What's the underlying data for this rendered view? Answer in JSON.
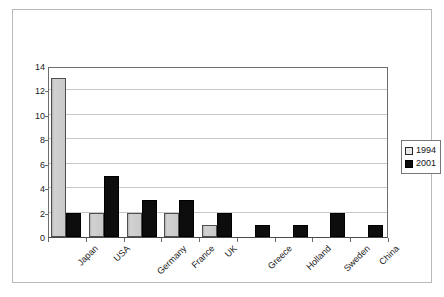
{
  "chart_data": {
    "type": "bar",
    "title": "",
    "subtitle": "",
    "xlabel": "",
    "ylabel": "",
    "ylim": [
      0,
      14
    ],
    "ytick_values": [
      0,
      2,
      4,
      6,
      8,
      10,
      12,
      14
    ],
    "ytick_labels": [
      "0",
      "2",
      "4",
      "6",
      "8",
      "10",
      "12",
      "14"
    ],
    "grid": true,
    "grid_axis": "y",
    "legend_position": "right",
    "categories": [
      "Japan",
      "USA",
      "Germany",
      "France",
      "UK",
      "Greece",
      "Holland",
      "Sweden",
      "China"
    ],
    "series": [
      {
        "name": "1994",
        "color": "#c3c3c3",
        "values": [
          13,
          2,
          2,
          2,
          1,
          0,
          0,
          0,
          0
        ]
      },
      {
        "name": "2001",
        "color": "#0d0d0d",
        "values": [
          2,
          5,
          3,
          3,
          2,
          1,
          1,
          2,
          1
        ]
      }
    ]
  },
  "legend": {
    "items": [
      {
        "label": "1994",
        "swatch": "legend-swatch-1994"
      },
      {
        "label": "2001",
        "swatch": "legend-swatch-2001"
      }
    ]
  },
  "colors": {
    "series_1994": "#c3c3c3",
    "series_2001": "#0d0d0d",
    "gridline": "#c8c8c8",
    "axis": "#6d6d6d",
    "frame": "#b9b9b9",
    "text": "#1a1a1a"
  }
}
